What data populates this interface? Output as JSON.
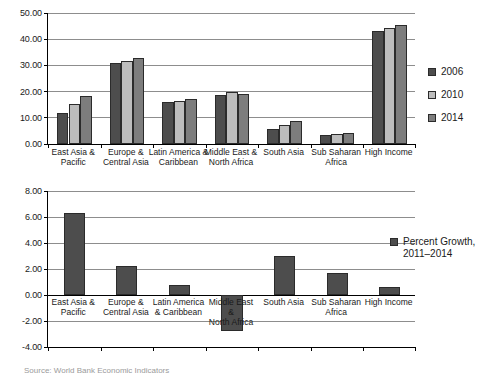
{
  "chart_data": [
    {
      "id": "top",
      "type": "bar",
      "title": "",
      "xlabel": "",
      "ylabel": "",
      "ylim": [
        0,
        50
      ],
      "ytick_step": 10,
      "ytick_labels": [
        "0.00",
        "10.00",
        "20.00",
        "30.00",
        "40.00",
        "50.00"
      ],
      "grid": true,
      "legend_position": "right",
      "categories": [
        "East Asia &\nPacific",
        "Europe &\nCentral Asia",
        "Latin America &\nCaribbean",
        "Middle East &\nNorth Africa",
        "South Asia",
        "Sub Saharan\nAfrica",
        "High Income"
      ],
      "series": [
        {
          "name": "2006",
          "color": "#4d4d4d",
          "values": [
            12.0,
            31.1,
            15.9,
            18.8,
            5.8,
            3.5,
            43.3
          ]
        },
        {
          "name": "2010",
          "color": "#bdbdbd",
          "values": [
            15.3,
            31.7,
            16.6,
            19.7,
            7.2,
            4.0,
            44.4
          ]
        },
        {
          "name": "2014",
          "color": "#7d7d7d",
          "values": [
            18.5,
            32.8,
            17.2,
            19.2,
            8.6,
            4.2,
            45.6
          ]
        }
      ]
    },
    {
      "id": "bottom",
      "type": "bar",
      "title": "",
      "xlabel": "",
      "ylabel": "",
      "ylim": [
        -4,
        8
      ],
      "ytick_step": 2,
      "ytick_labels": [
        "-4.00",
        "-2.00",
        "0.00",
        "2.00",
        "4.00",
        "6.00",
        "8.00"
      ],
      "grid": true,
      "legend_position": "right",
      "categories": [
        "East Asia &\nPacific",
        "Europe &\nCentral Asia",
        "Latin America\n& Caribbean",
        "Middle East\n&\nNorth Africa",
        "South Asia",
        "Sub Saharan\nAfrica",
        "High Income"
      ],
      "series": [
        {
          "name": "Percent Growth,\n2011–2014",
          "color": "#4d4d4d",
          "values": [
            6.3,
            2.2,
            0.8,
            -2.8,
            3.0,
            1.7,
            0.65
          ]
        }
      ]
    }
  ],
  "caption": {
    "text": "Source:  World Bank Economic Indicators"
  }
}
